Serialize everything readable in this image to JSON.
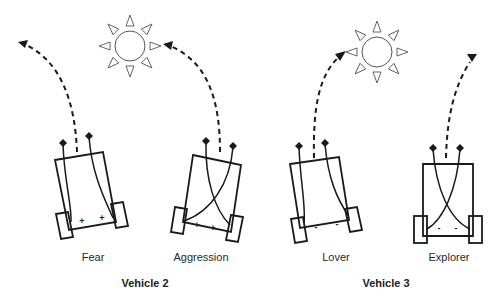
{
  "diagram": {
    "groups": [
      {
        "label": "Vehicle 2",
        "vehicles": [
          "Fear",
          "Aggression"
        ]
      },
      {
        "label": "Vehicle 3",
        "vehicles": [
          "Lover",
          "Explorer"
        ]
      }
    ],
    "vehicles": [
      {
        "name": "Fear",
        "connection": "uncrossed",
        "sign": "+",
        "signs": [
          "+",
          "+"
        ]
      },
      {
        "name": "Aggression",
        "connection": "crossed",
        "sign": "+",
        "signs": [
          "+",
          "+"
        ]
      },
      {
        "name": "Lover",
        "connection": "uncrossed",
        "sign": "-",
        "signs": [
          "-",
          "-"
        ]
      },
      {
        "name": "Explorer",
        "connection": "crossed",
        "sign": "-",
        "signs": [
          "-",
          "-"
        ]
      }
    ],
    "light_sources": [
      {
        "name": "sun",
        "near": "Aggression"
      },
      {
        "name": "sun",
        "near": "Lover"
      }
    ],
    "colors": {
      "ink": "#1a1a1a",
      "background": "#ffffff",
      "sun_stroke": "#555555"
    }
  }
}
